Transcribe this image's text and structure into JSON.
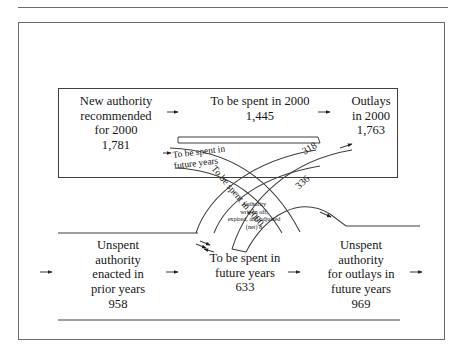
{
  "diagram": {
    "type": "budget-flow-sankey",
    "fiscal_year": "2000",
    "units_note": "",
    "top_band": {
      "source": {
        "label_line1": "New authority",
        "label_line2": "recommended",
        "label_line3": "for 2000",
        "value": "1,781"
      },
      "middle": {
        "label": "To be spent in 2000",
        "value": "1,445"
      },
      "sink": {
        "label_line1": "Outlays",
        "label_line2": "in 2000",
        "value": "1,763"
      }
    },
    "bottom_band": {
      "source": {
        "label_line1": "Unspent",
        "label_line2": "authority",
        "label_line3": "enacted in",
        "label_line4": "prior years",
        "value": "958"
      },
      "middle": {
        "label_line1": "To be spent in",
        "label_line2": "future years",
        "value": "633"
      },
      "sink": {
        "label_line1": "Unspent",
        "label_line2": "authority",
        "label_line3": "for outlays in",
        "label_line4": "future years",
        "value": "969"
      }
    },
    "cross_flows": [
      {
        "id": "new-to-future",
        "label_line1": "To be spent in",
        "label_line2": "future years",
        "value": ""
      },
      {
        "id": "prior-to-2000",
        "label": "To be spent in 2000",
        "value": ""
      },
      {
        "id": "outlays-318",
        "label": "",
        "value": "318"
      },
      {
        "id": "outlays-336",
        "label": "",
        "value": "336"
      },
      {
        "id": "written-off",
        "label_line1": "Authority",
        "label_line2": "written off,",
        "label_line3": "expired, and adjusted",
        "label_line4": "(net) 8",
        "value": "8"
      }
    ],
    "colors": {
      "ink": "#171717",
      "rule": "#6d6d6d",
      "frame": "#6b6b6b",
      "line": "#3f3f3f"
    }
  }
}
